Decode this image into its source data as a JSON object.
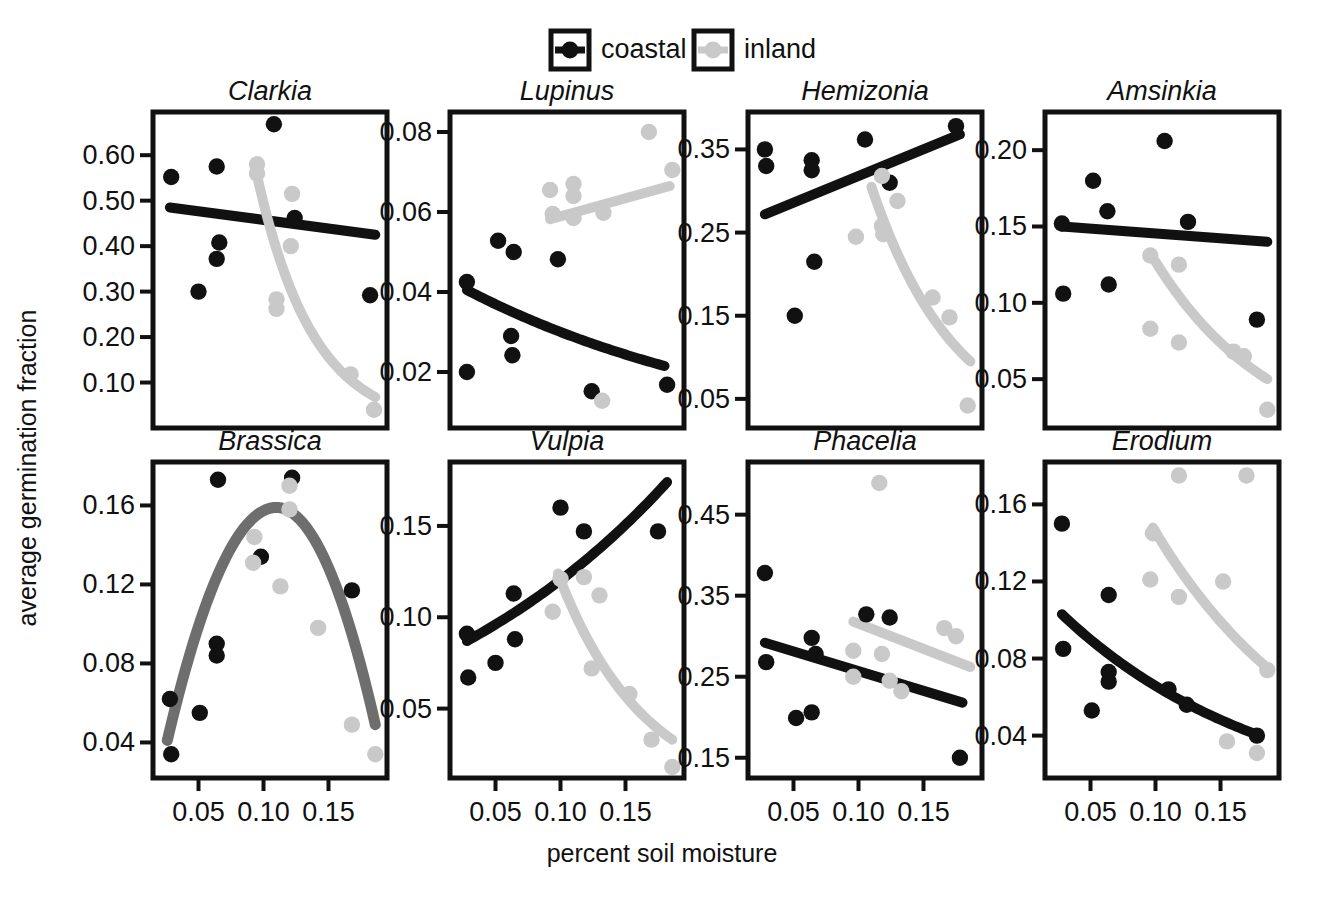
{
  "figure": {
    "xlabel": "percent soil moisture",
    "ylabel": "average germination fraction",
    "legend": {
      "position": "top-center",
      "items": [
        {
          "label": "coastal",
          "color": "#111111",
          "symbol": "boxed-line-point"
        },
        {
          "label": "inland",
          "color": "#c9c9c9",
          "symbol": "boxed-line-point"
        }
      ]
    },
    "colors": {
      "coastal": "#111111",
      "inland": "#c9c9c9",
      "combined": "#6e6e6e",
      "axis": "#111111",
      "background": "#ffffff"
    }
  },
  "chart_data": [
    {
      "type": "scatter",
      "title": "Clarkia",
      "xlabel": "percent soil moisture",
      "ylabel": "average germination fraction",
      "xlim": [
        0.015,
        0.195
      ],
      "ylim": [
        0.0,
        0.695
      ],
      "xticks": [
        0.05,
        0.1,
        0.15
      ],
      "yticks": [
        0.1,
        0.2,
        0.3,
        0.4,
        0.5,
        0.6
      ],
      "grid": false,
      "series": [
        {
          "name": "coastal",
          "color": "#111111",
          "points": [
            [
              0.029,
              0.552
            ],
            [
              0.05,
              0.3
            ],
            [
              0.064,
              0.575
            ],
            [
              0.066,
              0.408
            ],
            [
              0.064,
              0.372
            ],
            [
              0.108,
              0.668
            ],
            [
              0.124,
              0.462
            ],
            [
              0.182,
              0.292
            ]
          ],
          "fit": {
            "kind": "line",
            "x": [
              0.028,
              0.186
            ],
            "y": [
              0.485,
              0.425
            ]
          }
        },
        {
          "name": "inland",
          "color": "#c9c9c9",
          "points": [
            [
              0.095,
              0.58
            ],
            [
              0.095,
              0.56
            ],
            [
              0.122,
              0.515
            ],
            [
              0.121,
              0.4
            ],
            [
              0.11,
              0.283
            ],
            [
              0.11,
              0.262
            ],
            [
              0.167,
              0.118
            ],
            [
              0.185,
              0.04
            ]
          ],
          "fit": {
            "kind": "exp-decay",
            "x": [
              0.093,
              0.186
            ],
            "y": [
              0.582,
              0.068
            ]
          }
        }
      ]
    },
    {
      "type": "scatter",
      "title": "Lupinus",
      "xlabel": "percent soil moisture",
      "ylabel": "average germination fraction",
      "xlim": [
        0.015,
        0.195
      ],
      "ylim": [
        0.006,
        0.085
      ],
      "xticks": [
        0.05,
        0.1,
        0.15
      ],
      "yticks": [
        0.02,
        0.04,
        0.06,
        0.08
      ],
      "grid": false,
      "series": [
        {
          "name": "coastal",
          "color": "#111111",
          "points": [
            [
              0.028,
              0.0425
            ],
            [
              0.028,
              0.02
            ],
            [
              0.052,
              0.0528
            ],
            [
              0.064,
              0.05
            ],
            [
              0.062,
              0.029
            ],
            [
              0.063,
              0.0242
            ],
            [
              0.098,
              0.0482
            ],
            [
              0.124,
              0.0152
            ],
            [
              0.182,
              0.0168
            ]
          ],
          "fit": {
            "kind": "exp-decay",
            "x": [
              0.028,
              0.18
            ],
            "y": [
              0.0405,
              0.0215
            ]
          }
        },
        {
          "name": "inland",
          "color": "#c9c9c9",
          "points": [
            [
              0.092,
              0.0655
            ],
            [
              0.094,
              0.0595
            ],
            [
              0.11,
              0.067
            ],
            [
              0.11,
              0.064
            ],
            [
              0.11,
              0.0585
            ],
            [
              0.133,
              0.0598
            ],
            [
              0.168,
              0.08
            ],
            [
              0.186,
              0.0705
            ],
            [
              0.132,
              0.0128
            ]
          ],
          "fit": {
            "kind": "line",
            "x": [
              0.092,
              0.184
            ],
            "y": [
              0.0582,
              0.0665
            ]
          }
        }
      ]
    },
    {
      "type": "scatter",
      "title": "Hemizonia",
      "xlabel": "percent soil moisture",
      "ylabel": "average germination fraction",
      "xlim": [
        0.015,
        0.195
      ],
      "ylim": [
        0.015,
        0.395
      ],
      "xticks": [
        0.05,
        0.1,
        0.15
      ],
      "yticks": [
        0.05,
        0.15,
        0.25,
        0.35
      ],
      "grid": false,
      "series": [
        {
          "name": "coastal",
          "color": "#111111",
          "points": [
            [
              0.028,
              0.35
            ],
            [
              0.029,
              0.33
            ],
            [
              0.051,
              0.15
            ],
            [
              0.064,
              0.337
            ],
            [
              0.064,
              0.325
            ],
            [
              0.066,
              0.215
            ],
            [
              0.105,
              0.362
            ],
            [
              0.124,
              0.31
            ],
            [
              0.175,
              0.378
            ]
          ],
          "fit": {
            "kind": "line",
            "x": [
              0.028,
              0.178
            ],
            "y": [
              0.272,
              0.368
            ]
          }
        },
        {
          "name": "inland",
          "color": "#c9c9c9",
          "points": [
            [
              0.098,
              0.245
            ],
            [
              0.118,
              0.318
            ],
            [
              0.118,
              0.258
            ],
            [
              0.119,
              0.248
            ],
            [
              0.13,
              0.288
            ],
            [
              0.157,
              0.172
            ],
            [
              0.17,
              0.148
            ],
            [
              0.184,
              0.042
            ]
          ],
          "fit": {
            "kind": "exp-decay",
            "x": [
              0.11,
              0.186
            ],
            "y": [
              0.305,
              0.095
            ]
          }
        }
      ]
    },
    {
      "type": "scatter",
      "title": "Amsinkia",
      "xlabel": "percent soil moisture",
      "ylabel": "average germination fraction",
      "xlim": [
        0.015,
        0.195
      ],
      "ylim": [
        0.018,
        0.225
      ],
      "xticks": [
        0.05,
        0.1,
        0.15
      ],
      "yticks": [
        0.05,
        0.1,
        0.15,
        0.2
      ],
      "grid": false,
      "series": [
        {
          "name": "coastal",
          "color": "#111111",
          "points": [
            [
              0.028,
              0.152
            ],
            [
              0.029,
              0.106
            ],
            [
              0.052,
              0.18
            ],
            [
              0.063,
              0.16
            ],
            [
              0.064,
              0.112
            ],
            [
              0.107,
              0.206
            ],
            [
              0.125,
              0.153
            ],
            [
              0.178,
              0.089
            ]
          ],
          "fit": {
            "kind": "line",
            "x": [
              0.028,
              0.186
            ],
            "y": [
              0.15,
              0.14
            ]
          }
        },
        {
          "name": "inland",
          "color": "#c9c9c9",
          "points": [
            [
              0.096,
              0.131
            ],
            [
              0.096,
              0.083
            ],
            [
              0.118,
              0.125
            ],
            [
              0.118,
              0.074
            ],
            [
              0.16,
              0.068
            ],
            [
              0.168,
              0.065
            ],
            [
              0.186,
              0.03
            ]
          ],
          "fit": {
            "kind": "exp-decay",
            "x": [
              0.1,
              0.186
            ],
            "y": [
              0.127,
              0.05
            ]
          }
        }
      ]
    },
    {
      "type": "scatter",
      "title": "Brassica",
      "xlabel": "percent soil moisture",
      "ylabel": "average germination fraction",
      "xlim": [
        0.015,
        0.195
      ],
      "ylim": [
        0.022,
        0.182
      ],
      "xticks": [
        0.05,
        0.1,
        0.15
      ],
      "yticks": [
        0.04,
        0.08,
        0.12,
        0.16
      ],
      "grid": false,
      "series": [
        {
          "name": "coastal",
          "color": "#111111",
          "points": [
            [
              0.028,
              0.062
            ],
            [
              0.029,
              0.034
            ],
            [
              0.051,
              0.055
            ],
            [
              0.064,
              0.09
            ],
            [
              0.064,
              0.084
            ],
            [
              0.065,
              0.173
            ],
            [
              0.098,
              0.134
            ],
            [
              0.122,
              0.174
            ],
            [
              0.168,
              0.117
            ]
          ],
          "fit": null
        },
        {
          "name": "inland",
          "color": "#c9c9c9",
          "points": [
            [
              0.093,
              0.144
            ],
            [
              0.092,
              0.131
            ],
            [
              0.12,
              0.17
            ],
            [
              0.12,
              0.158
            ],
            [
              0.113,
              0.119
            ],
            [
              0.142,
              0.098
            ],
            [
              0.168,
              0.049
            ],
            [
              0.186,
              0.034
            ]
          ],
          "fit": null
        },
        {
          "name": "combined",
          "color": "#6e6e6e",
          "points": [],
          "fit": {
            "kind": "hump",
            "x": [
              0.026,
              0.186
            ],
            "peak_x": 0.11,
            "peak_y": 0.159,
            "y_ends": [
              0.041,
              0.049
            ]
          }
        }
      ]
    },
    {
      "type": "scatter",
      "title": "Vulpia",
      "xlabel": "percent soil moisture",
      "ylabel": "average germination fraction",
      "xlim": [
        0.015,
        0.195
      ],
      "ylim": [
        0.012,
        0.185
      ],
      "xticks": [
        0.05,
        0.1,
        0.15
      ],
      "yticks": [
        0.05,
        0.1,
        0.15
      ],
      "grid": false,
      "series": [
        {
          "name": "coastal",
          "color": "#111111",
          "points": [
            [
              0.028,
              0.091
            ],
            [
              0.029,
              0.067
            ],
            [
              0.05,
              0.075
            ],
            [
              0.064,
              0.113
            ],
            [
              0.065,
              0.088
            ],
            [
              0.1,
              0.16
            ],
            [
              0.118,
              0.147
            ],
            [
              0.175,
              0.147
            ]
          ],
          "fit": {
            "kind": "exp-growth",
            "x": [
              0.028,
              0.182
            ],
            "y": [
              0.087,
              0.174
            ]
          }
        },
        {
          "name": "inland",
          "color": "#c9c9c9",
          "points": [
            [
              0.094,
              0.103
            ],
            [
              0.1,
              0.121
            ],
            [
              0.118,
              0.122
            ],
            [
              0.13,
              0.112
            ],
            [
              0.124,
              0.072
            ],
            [
              0.153,
              0.058
            ],
            [
              0.17,
              0.033
            ],
            [
              0.186,
              0.018
            ]
          ],
          "fit": {
            "kind": "exp-decay",
            "x": [
              0.098,
              0.186
            ],
            "y": [
              0.124,
              0.033
            ]
          }
        }
      ]
    },
    {
      "type": "scatter",
      "title": "Phacelia",
      "xlabel": "percent soil moisture",
      "ylabel": "average germination fraction",
      "xlim": [
        0.015,
        0.195
      ],
      "ylim": [
        0.125,
        0.515
      ],
      "xticks": [
        0.05,
        0.1,
        0.15
      ],
      "yticks": [
        0.15,
        0.25,
        0.35,
        0.45
      ],
      "grid": false,
      "series": [
        {
          "name": "coastal",
          "color": "#111111",
          "points": [
            [
              0.028,
              0.378
            ],
            [
              0.029,
              0.268
            ],
            [
              0.052,
              0.199
            ],
            [
              0.064,
              0.298
            ],
            [
              0.064,
              0.206
            ],
            [
              0.067,
              0.278
            ],
            [
              0.106,
              0.327
            ],
            [
              0.124,
              0.323
            ],
            [
              0.178,
              0.15
            ]
          ],
          "fit": {
            "kind": "line",
            "x": [
              0.028,
              0.18
            ],
            "y": [
              0.292,
              0.218
            ]
          }
        },
        {
          "name": "inland",
          "color": "#c9c9c9",
          "points": [
            [
              0.096,
              0.282
            ],
            [
              0.096,
              0.25
            ],
            [
              0.116,
              0.489
            ],
            [
              0.118,
              0.278
            ],
            [
              0.124,
              0.245
            ],
            [
              0.133,
              0.232
            ],
            [
              0.166,
              0.31
            ],
            [
              0.175,
              0.3
            ]
          ],
          "fit": {
            "kind": "line",
            "x": [
              0.096,
              0.186
            ],
            "y": [
              0.318,
              0.262
            ]
          }
        }
      ]
    },
    {
      "type": "scatter",
      "title": "Erodium",
      "xlabel": "percent soil moisture",
      "ylabel": "average germination fraction",
      "xlim": [
        0.015,
        0.195
      ],
      "ylim": [
        0.018,
        0.182
      ],
      "xticks": [
        0.05,
        0.1,
        0.15
      ],
      "yticks": [
        0.04,
        0.08,
        0.12,
        0.16
      ],
      "grid": false,
      "series": [
        {
          "name": "coastal",
          "color": "#111111",
          "points": [
            [
              0.028,
              0.15
            ],
            [
              0.029,
              0.085
            ],
            [
              0.051,
              0.053
            ],
            [
              0.064,
              0.113
            ],
            [
              0.064,
              0.073
            ],
            [
              0.064,
              0.068
            ],
            [
              0.11,
              0.064
            ],
            [
              0.124,
              0.056
            ],
            [
              0.178,
              0.04
            ]
          ],
          "fit": {
            "kind": "exp-decay",
            "x": [
              0.028,
              0.18
            ],
            "y": [
              0.103,
              0.04
            ]
          }
        },
        {
          "name": "inland",
          "color": "#c9c9c9",
          "points": [
            [
              0.098,
              0.145
            ],
            [
              0.096,
              0.121
            ],
            [
              0.118,
              0.175
            ],
            [
              0.118,
              0.112
            ],
            [
              0.152,
              0.12
            ],
            [
              0.17,
              0.175
            ],
            [
              0.155,
              0.037
            ],
            [
              0.178,
              0.031
            ],
            [
              0.186,
              0.074
            ]
          ],
          "fit": {
            "kind": "exp-decay",
            "x": [
              0.098,
              0.188
            ],
            "y": [
              0.148,
              0.074
            ]
          }
        }
      ]
    }
  ]
}
